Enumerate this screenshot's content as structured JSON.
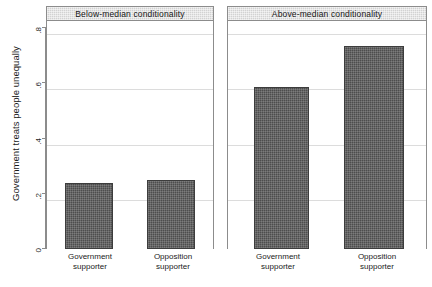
{
  "chart_data": {
    "type": "bar",
    "title": "",
    "xlabel": "",
    "ylabel": "Government treats people unequally",
    "ylim": [
      0,
      0.8
    ],
    "yticks": [
      0,
      0.2,
      0.4,
      0.6,
      0.8
    ],
    "ytick_labels": [
      "0",
      ".2",
      ".4",
      ".6",
      ".8"
    ],
    "grid": true,
    "legend": "none",
    "categories": [
      "Government supporter",
      "Opposition supporter"
    ],
    "panels": [
      {
        "title": "Below-median conditionality",
        "categories": [
          "Government supporter",
          "Opposition supporter"
        ],
        "values": [
          0.24,
          0.25
        ]
      },
      {
        "title": "Above-median conditionality",
        "categories": [
          "Government supporter",
          "Opposition supporter"
        ],
        "values": [
          0.585,
          0.735
        ]
      }
    ],
    "bar_color": "#4d4d4d",
    "panel_header_color": "#d2d2d2",
    "grid_color": "#dcdcdc",
    "axis_color": "#8c8c8c"
  },
  "category_lines": {
    "government": {
      "line1": "Government",
      "line2": "supporter"
    },
    "opposition": {
      "line1": "Opposition",
      "line2": "supporter"
    }
  }
}
